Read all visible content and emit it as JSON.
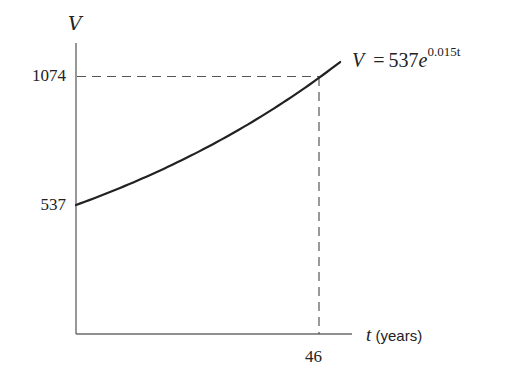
{
  "chart_data": {
    "type": "line",
    "title": "",
    "xlabel_var": "t",
    "xlabel_unit": "(years)",
    "ylabel": "V",
    "equation": {
      "lhs": "V",
      "eq": "=",
      "coef": "537",
      "base": "e",
      "exponent": "0.015t"
    },
    "function": "V = 537e^(0.015t)",
    "x_ticks": [
      46
    ],
    "x_tick_labels": [
      "46"
    ],
    "y_ticks": [
      537,
      1074
    ],
    "y_tick_labels": [
      "537",
      "1074"
    ],
    "x": [
      0,
      5,
      10,
      15,
      20,
      25,
      30,
      35,
      40,
      46,
      50
    ],
    "values": [
      537,
      577,
      624,
      672,
      725,
      781,
      842,
      908,
      979,
      1074,
      1137
    ],
    "annotations": [
      {
        "type": "dashed-guide",
        "x": 46,
        "y": 1074,
        "description": "doubling point: V reaches 1074 at t = 46"
      }
    ],
    "xlim": [
      0,
      52
    ],
    "ylim": [
      0,
      1230
    ],
    "grid": false,
    "legend": "none",
    "colors": {
      "curve": "#222222",
      "axes": "#666666",
      "guides": "#555555"
    }
  }
}
